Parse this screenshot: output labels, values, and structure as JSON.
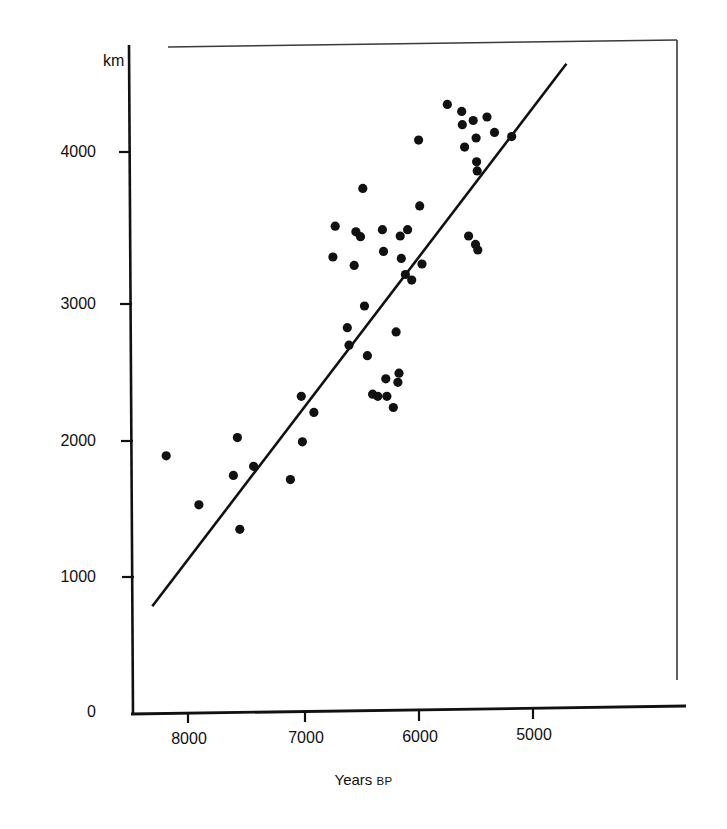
{
  "figure": {
    "ghost_caption": "",
    "y_unit_label": "km",
    "x_axis_title_main": "Years",
    "x_axis_title_suffix": "BP",
    "axis_color": "#111111",
    "point_color": "#111111",
    "line_color": "#111111",
    "frame_color": "#333333"
  },
  "chart_data": {
    "type": "scatter",
    "title": "",
    "xlabel": "Years BP",
    "ylabel": "km",
    "xlim": [
      8400,
      4550
    ],
    "ylim": [
      0,
      4600
    ],
    "x_inverted": true,
    "grid": false,
    "legend": null,
    "xticks": [
      8000,
      7000,
      6000,
      5000
    ],
    "xtick_labels": [
      "8000",
      "7000",
      "6000",
      "5000"
    ],
    "yticks": [
      0,
      1000,
      2000,
      3000,
      4000
    ],
    "ytick_labels": [
      "0",
      "1000",
      "2000",
      "3000",
      "4000"
    ],
    "annotations": [
      {
        "text": "km",
        "role": "y-axis-unit"
      },
      {
        "text": "Years BP",
        "role": "x-axis-title"
      }
    ],
    "series": [
      {
        "name": "sites",
        "marker": "filled-circle",
        "points": [
          {
            "x": 8190,
            "y": 1830
          },
          {
            "x": 7570,
            "y": 1960
          },
          {
            "x": 7905,
            "y": 1480
          },
          {
            "x": 7605,
            "y": 1690
          },
          {
            "x": 7430,
            "y": 1755
          },
          {
            "x": 7550,
            "y": 1305
          },
          {
            "x": 7110,
            "y": 1660
          },
          {
            "x": 7005,
            "y": 1930
          },
          {
            "x": 7015,
            "y": 2255
          },
          {
            "x": 6905,
            "y": 2140
          },
          {
            "x": 6740,
            "y": 3250
          },
          {
            "x": 6720,
            "y": 3470
          },
          {
            "x": 6615,
            "y": 2745
          },
          {
            "x": 6600,
            "y": 2620
          },
          {
            "x": 6555,
            "y": 3190
          },
          {
            "x": 6540,
            "y": 3430
          },
          {
            "x": 6500,
            "y": 3395
          },
          {
            "x": 6480,
            "y": 3740
          },
          {
            "x": 6465,
            "y": 2900
          },
          {
            "x": 6440,
            "y": 2545
          },
          {
            "x": 6395,
            "y": 2270
          },
          {
            "x": 6350,
            "y": 2255
          },
          {
            "x": 6310,
            "y": 3445
          },
          {
            "x": 6300,
            "y": 3290
          },
          {
            "x": 6280,
            "y": 2380
          },
          {
            "x": 6270,
            "y": 2255
          },
          {
            "x": 6215,
            "y": 2175
          },
          {
            "x": 6190,
            "y": 2715
          },
          {
            "x": 6175,
            "y": 2355
          },
          {
            "x": 6165,
            "y": 2420
          },
          {
            "x": 6155,
            "y": 3400
          },
          {
            "x": 6145,
            "y": 3240
          },
          {
            "x": 6110,
            "y": 3125
          },
          {
            "x": 6090,
            "y": 3445
          },
          {
            "x": 6055,
            "y": 3085
          },
          {
            "x": 5995,
            "y": 4085
          },
          {
            "x": 5985,
            "y": 3615
          },
          {
            "x": 5965,
            "y": 3200
          },
          {
            "x": 5745,
            "y": 4340
          },
          {
            "x": 5620,
            "y": 4290
          },
          {
            "x": 5615,
            "y": 4195
          },
          {
            "x": 5595,
            "y": 4035
          },
          {
            "x": 5500,
            "y": 3340
          },
          {
            "x": 5480,
            "y": 3300
          },
          {
            "x": 5560,
            "y": 3400
          },
          {
            "x": 5520,
            "y": 4225
          },
          {
            "x": 5495,
            "y": 4100
          },
          {
            "x": 5490,
            "y": 3930
          },
          {
            "x": 5485,
            "y": 3865
          },
          {
            "x": 5400,
            "y": 4250
          },
          {
            "x": 5335,
            "y": 4140
          },
          {
            "x": 5185,
            "y": 4110
          }
        ]
      }
    ],
    "trendline": {
      "type": "linear-fit",
      "x_start": 8310,
      "y_start": 755,
      "x_end": 4710,
      "y_end": 4630
    }
  }
}
